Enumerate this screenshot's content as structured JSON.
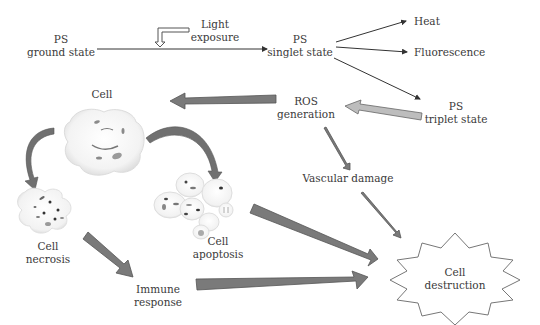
{
  "diagram": {
    "colors": {
      "dark_arrow": "#7a7a7a",
      "light_arrow": "#bdbdbd",
      "line": "#333333",
      "text": "#3a3a3a",
      "cell_fill": "#f4f4f4",
      "organelle": "#7d7d7d"
    },
    "nodes": {
      "ps_ground": {
        "line1": "PS",
        "line2": "ground state"
      },
      "light": {
        "line1": "Light",
        "line2": "exposure"
      },
      "ps_singlet": {
        "line1": "PS",
        "line2": "singlet state"
      },
      "heat": {
        "label": "Heat"
      },
      "fluorescence": {
        "label": "Fluorescence"
      },
      "ps_triplet": {
        "line1": "PS",
        "line2": "triplet state"
      },
      "ros": {
        "line1": "ROS",
        "line2": "generation"
      },
      "vascular": {
        "label": "Vascular damage"
      },
      "cell": {
        "label": "Cell"
      },
      "necrosis": {
        "line1": "Cell",
        "line2": "necrosis"
      },
      "apoptosis": {
        "line1": "Cell",
        "line2": "apoptosis"
      },
      "immune": {
        "line1": "Immune",
        "line2": "response"
      },
      "destruction": {
        "line1": "Cell",
        "line2": "destruction"
      }
    },
    "edges": [
      {
        "from": "PS ground state",
        "to": "PS singlet state",
        "style": "thin-line"
      },
      {
        "from": "Light exposure",
        "to": "PS ground state arrow",
        "style": "outline-arrow"
      },
      {
        "from": "PS singlet state",
        "to": "Heat",
        "style": "thin-line"
      },
      {
        "from": "PS singlet state",
        "to": "Fluorescence",
        "style": "thin-line"
      },
      {
        "from": "PS singlet state",
        "to": "PS triplet state",
        "style": "thin-line"
      },
      {
        "from": "PS triplet state",
        "to": "ROS generation",
        "style": "light-block-arrow"
      },
      {
        "from": "ROS generation",
        "to": "Cell",
        "style": "dark-block-arrow"
      },
      {
        "from": "ROS generation",
        "to": "Vascular damage",
        "style": "dark-thin-arrow"
      },
      {
        "from": "Cell",
        "to": "Cell necrosis",
        "style": "curved-arrow"
      },
      {
        "from": "Cell",
        "to": "Cell apoptosis",
        "style": "curved-arrow"
      },
      {
        "from": "Cell necrosis",
        "to": "Immune response",
        "style": "dark-block-arrow"
      },
      {
        "from": "Cell apoptosis",
        "to": "Cell destruction",
        "style": "dark-block-arrow"
      },
      {
        "from": "Immune response",
        "to": "Cell destruction",
        "style": "dark-block-arrow"
      },
      {
        "from": "Vascular damage",
        "to": "Cell destruction",
        "style": "dark-thin-arrow"
      }
    ]
  }
}
